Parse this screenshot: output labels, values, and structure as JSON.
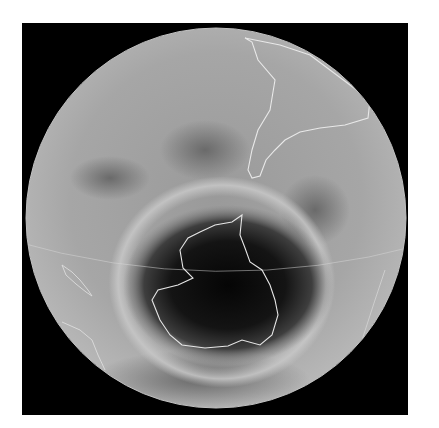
{
  "image": {
    "subject": "ozone-hole-over-antarctica",
    "background_color": "#ffffff",
    "frame_color": "#000000",
    "globe": {
      "center": [
        216,
        218
      ],
      "radius": 190,
      "base_color": "#a9a9a9",
      "hole_color": "#0d0d0d",
      "coastline_color": "#e8e8e8"
    }
  }
}
